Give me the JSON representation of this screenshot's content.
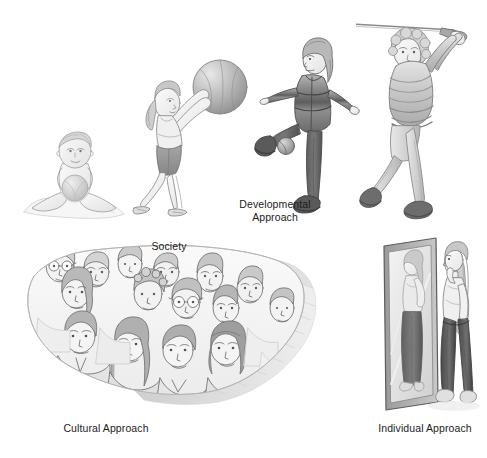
{
  "figure": {
    "background_color": "#ffffff",
    "width": 487,
    "height": 458
  },
  "labels": {
    "developmental": "Developmental\nApproach",
    "developmental_line1": "Developmental",
    "developmental_line2": "Approach",
    "society": "Society",
    "cultural": "Cultural Approach",
    "individual": "Individual Approach"
  },
  "scenes": [
    {
      "id": "infant",
      "name": "infant-sitting-with-ball",
      "description": "Pencil sketch of a seated baby holding a ball",
      "stage": "infancy",
      "group": "developmental"
    },
    {
      "id": "child",
      "name": "child-holding-beach-ball",
      "description": "Pencil sketch of a girl in shorts and tank top holding a large beach ball overhead",
      "stage": "childhood",
      "group": "developmental"
    },
    {
      "id": "adolescent",
      "name": "adolescent-kicking-ball",
      "description": "Pencil sketch of a teenager in a striped jacket kicking a ball",
      "stage": "adolescence",
      "group": "developmental"
    },
    {
      "id": "adult",
      "name": "adult-golf-swing",
      "description": "Pencil sketch of an older woman following through on a golf swing",
      "stage": "adulthood",
      "group": "developmental"
    },
    {
      "id": "society-map",
      "name": "us-map-with-crowd-of-faces",
      "description": "Pencil sketch of a United States map filled with a crowd of diverse faces, with an extruded 3D edge",
      "group": "cultural"
    },
    {
      "id": "mirror",
      "name": "woman-facing-full-length-mirror",
      "description": "Pencil sketch of a woman with long hair looking at her reflection in a full-length mirror",
      "group": "individual"
    }
  ],
  "colors": {
    "text": "#1c1c1c",
    "sketch_line": "#4a4a4a",
    "sketch_light": "#9a9a9a",
    "sketch_fill": "#d8d8d8",
    "sketch_mid": "#b4b4b4",
    "sketch_dark": "#6d6d6d",
    "background": "#ffffff"
  }
}
